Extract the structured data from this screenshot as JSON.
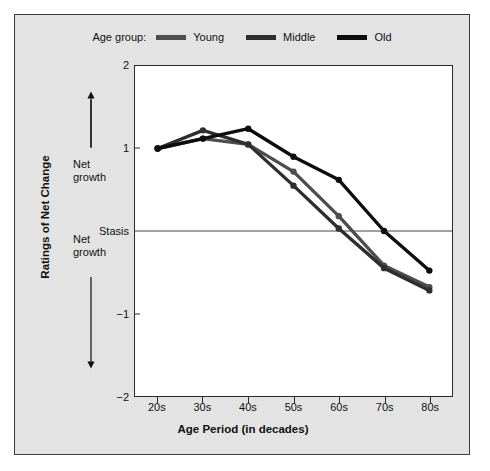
{
  "legend": {
    "title": "Age group:",
    "items": [
      {
        "label": "Young",
        "color": "#4d4d4d"
      },
      {
        "label": "Middle",
        "color": "#2e2e2e"
      },
      {
        "label": "Old",
        "color": "#0d0d0d"
      }
    ]
  },
  "axis": {
    "ylabel": "Ratings of Net Change",
    "xlabel": "Age Period (in decades)",
    "yticks": [
      "2",
      "1",
      "Stasis",
      "−1",
      "−2"
    ],
    "ytick_values": [
      2,
      1,
      0,
      -1,
      -2
    ],
    "xticks": [
      "20s",
      "30s",
      "40s",
      "50s",
      "60s",
      "70s",
      "80s"
    ],
    "zone_upper": "Net\ngrowth",
    "zone_lower": "Net\ngrowth"
  },
  "chart_data": {
    "type": "line",
    "title": "",
    "xlabel": "Age Period (in decades)",
    "ylabel": "Ratings of Net Change",
    "categories": [
      "20s",
      "30s",
      "40s",
      "50s",
      "60s",
      "70s",
      "80s"
    ],
    "ylim": [
      -2,
      2
    ],
    "grid": false,
    "legend_position": "top",
    "reference_line": {
      "value": 0,
      "label": "Stasis"
    },
    "series": [
      {
        "name": "Young",
        "color": "#4d4d4d",
        "values": [
          1.0,
          1.12,
          1.05,
          0.72,
          0.18,
          -0.42,
          -0.68
        ]
      },
      {
        "name": "Middle",
        "color": "#2e2e2e",
        "values": [
          1.0,
          1.22,
          1.05,
          0.55,
          0.03,
          -0.45,
          -0.72
        ]
      },
      {
        "name": "Old",
        "color": "#0d0d0d",
        "values": [
          1.0,
          1.12,
          1.24,
          0.9,
          0.62,
          0.0,
          -0.48
        ]
      }
    ]
  }
}
